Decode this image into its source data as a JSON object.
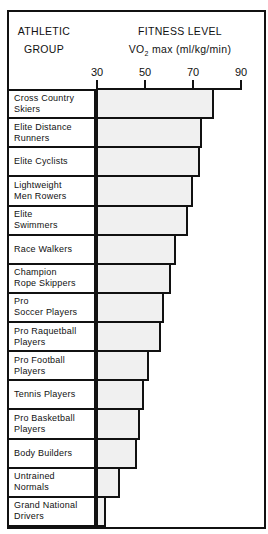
{
  "header": {
    "group_line1": "ATHLETIC",
    "group_line2": "GROUP",
    "fitness_line1": "FITNESS LEVEL",
    "fitness_vo": "VO",
    "fitness_sub": "2",
    "fitness_rest": " max (ml/kg/min)"
  },
  "axis": {
    "ticks": [
      "30",
      "50",
      "70",
      "90"
    ]
  },
  "rows": [
    {
      "line1": "Cross Country",
      "line2": "Skiers",
      "value": 79
    },
    {
      "line1": "Elite Distance",
      "line2": "Runners",
      "value": 74
    },
    {
      "line1": "Elite Cyclists",
      "line2": "",
      "value": 73
    },
    {
      "line1": "Lightweight",
      "line2": "Men Rowers",
      "value": 70
    },
    {
      "line1": "Elite",
      "line2": "Swimmers",
      "value": 68
    },
    {
      "line1": "Race Walkers",
      "line2": "",
      "value": 63
    },
    {
      "line1": "Champion",
      "line2": "Rope Skippers",
      "value": 61
    },
    {
      "line1": "Pro",
      "line2": "Soccer Players",
      "value": 58
    },
    {
      "line1": "Pro Raquetball",
      "line2": "Players",
      "value": 57
    },
    {
      "line1": "Pro Football",
      "line2": "Players",
      "value": 52
    },
    {
      "line1": "Tennis Players",
      "line2": "",
      "value": 50
    },
    {
      "line1": "Pro Basketball",
      "line2": "Players",
      "value": 48
    },
    {
      "line1": "Body Builders",
      "line2": "",
      "value": 47
    },
    {
      "line1": "Untrained",
      "line2": "Normals",
      "value": 40
    },
    {
      "line1": "Grand National",
      "line2": "Drivers",
      "value": 34
    }
  ],
  "chart_data": {
    "type": "bar",
    "orientation": "horizontal",
    "title": "FITNESS LEVEL VO2 max (ml/kg/min)",
    "xlabel": "VO2 max (ml/kg/min)",
    "ylabel": "ATHLETIC GROUP",
    "categories": [
      "Cross Country Skiers",
      "Elite Distance Runners",
      "Elite Cyclists",
      "Lightweight Men Rowers",
      "Elite Swimmers",
      "Race Walkers",
      "Champion Rope Skippers",
      "Pro Soccer Players",
      "Pro Raquetball Players",
      "Pro Football Players",
      "Tennis Players",
      "Pro Basketball Players",
      "Body Builders",
      "Untrained Normals",
      "Grand National Drivers"
    ],
    "values": [
      79,
      74,
      73,
      70,
      68,
      63,
      61,
      58,
      57,
      52,
      50,
      48,
      47,
      40,
      34
    ],
    "xlim": [
      30,
      90
    ],
    "xticks": [
      30,
      50,
      70,
      90
    ],
    "grid": false,
    "legend": "none",
    "bar_color": "#f0f0f0"
  }
}
